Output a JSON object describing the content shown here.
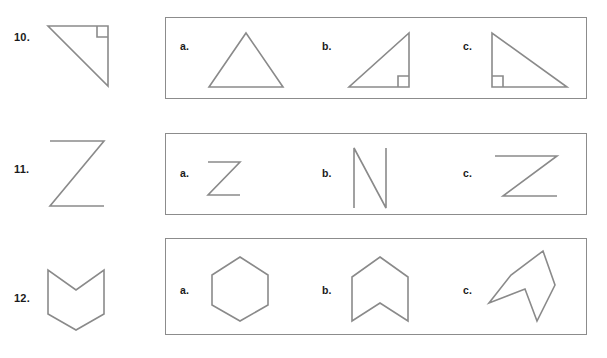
{
  "worksheet": {
    "title": "Shape matching worksheet",
    "line_color": "#8a8a8a",
    "box_border_color": "#8c8c8c",
    "text_color": "#1a1a1a",
    "background": "#ffffff"
  },
  "problems": [
    {
      "number": "10.",
      "prompt_shape": "right-triangle-right-angle-top-right",
      "choices": [
        {
          "label": "a.",
          "shape": "equilateral-triangle"
        },
        {
          "label": "b.",
          "shape": "right-triangle-right-angle-bottom-right"
        },
        {
          "label": "c.",
          "shape": "right-triangle-right-angle-bottom-left"
        }
      ]
    },
    {
      "number": "11.",
      "prompt_shape": "letter-z-large",
      "choices": [
        {
          "label": "a.",
          "shape": "letter-z-small"
        },
        {
          "label": "b.",
          "shape": "letter-n"
        },
        {
          "label": "c.",
          "shape": "letter-z-wide"
        }
      ]
    },
    {
      "number": "12.",
      "prompt_shape": "chevron-notched-pentagon-down",
      "choices": [
        {
          "label": "a.",
          "shape": "hexagon"
        },
        {
          "label": "b.",
          "shape": "chevron-notched-pentagon-up"
        },
        {
          "label": "c.",
          "shape": "chevron-notched-pentagon-rotated"
        }
      ]
    }
  ]
}
